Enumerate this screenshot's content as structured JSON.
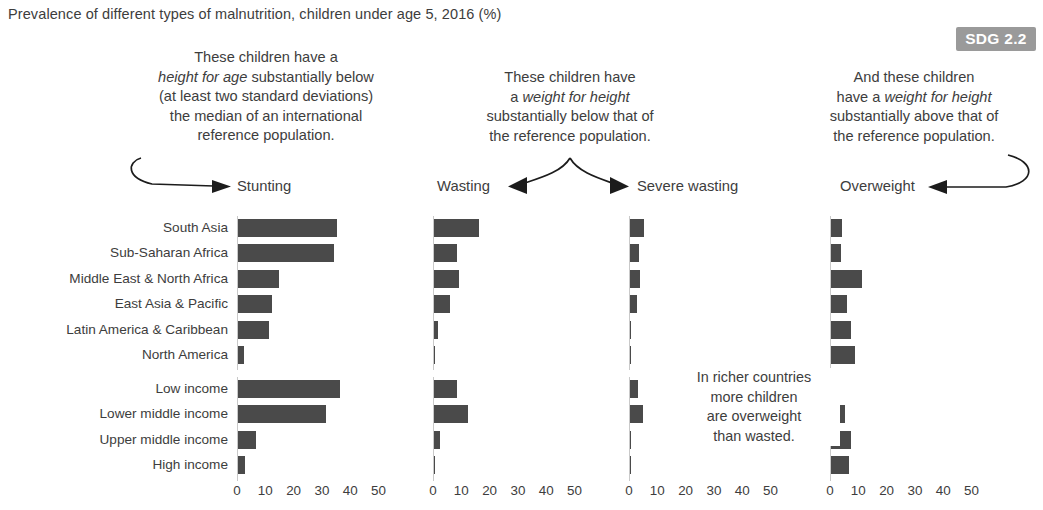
{
  "title": "Prevalence of different types of malnutrition, children under age 5, 2016 (%)",
  "badge": {
    "label": "SDG 2.2"
  },
  "annotations": {
    "stunting": {
      "lines": [
        "These children have a",
        "height for age substantially below",
        "(at least two standard deviations)",
        "the median of an international",
        "reference population."
      ],
      "italic_phrase": "height for age"
    },
    "wasting": {
      "lines": [
        "These children have",
        "a weight for height",
        "substantially below that of",
        "the reference population."
      ],
      "italic_phrase": "weight for height"
    },
    "overweight": {
      "lines": [
        "And these children",
        "have a weight for height",
        "substantially above that of",
        "the reference population."
      ],
      "italic_phrase": "weight for height"
    },
    "richer_note": {
      "lines": [
        "In richer countries",
        "more children",
        "are overweight",
        "than wasted."
      ]
    }
  },
  "colors": {
    "bar": "#4a4a4a",
    "badge_bg": "#9a9a9a",
    "text": "#3d3d3d",
    "axis": "#c9c9c9"
  },
  "chart_data": {
    "type": "bar",
    "title": "Prevalence of different types of malnutrition, children under age 5, 2016 (%)",
    "xlabel": "",
    "ylabel": "",
    "xlim": [
      0,
      55
    ],
    "ticks": [
      0,
      10,
      20,
      30,
      40,
      50
    ],
    "grid": false,
    "legend": "none",
    "orientation": "horizontal",
    "panels": [
      "Stunting",
      "Wasting",
      "Severe wasting",
      "Overweight"
    ],
    "groups": [
      {
        "name": "regions",
        "categories": [
          "South Asia",
          "Sub-Saharan Africa",
          "Middle East & North Africa",
          "East Asia & Pacific",
          "Latin America & Caribbean",
          "North America"
        ]
      },
      {
        "name": "income",
        "categories": [
          "Low income",
          "Lower middle income",
          "Upper middle income",
          "High income"
        ]
      }
    ],
    "series": [
      {
        "name": "Stunting",
        "values": [
          35.0,
          34.0,
          14.5,
          12.0,
          11.0,
          2.1,
          36.0,
          31.0,
          6.5,
          2.5
        ]
      },
      {
        "name": "Wasting",
        "values": [
          16.0,
          8.0,
          9.0,
          5.5,
          1.3,
          0.5,
          8.0,
          12.0,
          2.0,
          0.5
        ]
      },
      {
        "name": "Severe wasting",
        "values": [
          5.0,
          3.3,
          3.5,
          2.3,
          0.3,
          0.2,
          2.8,
          4.5,
          0.5,
          0.2
        ]
      },
      {
        "name": "Overweight",
        "values": [
          4.0,
          3.5,
          11.0,
          5.5,
          7.0,
          8.5,
          3.0,
          5.0,
          7.0,
          6.5
        ]
      }
    ],
    "note": "Severe wasting panel for the income group block is partly replaced by an explanatory note."
  },
  "captions": {
    "stunting": "Stunting",
    "wasting": "Wasting",
    "severe_wasting": "Severe wasting",
    "overweight": "Overweight"
  }
}
